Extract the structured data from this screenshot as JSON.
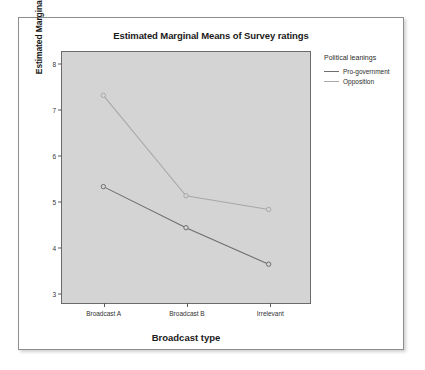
{
  "chart_data": {
    "type": "line",
    "title": "Estimated Marginal Means of Survey ratings",
    "xlabel": "Broadcast type",
    "ylabel": "Estimated Marginal Means",
    "categories": [
      "Broadcast A",
      "Broadcast B",
      "Irrelevant"
    ],
    "yticks": [
      "3",
      "4",
      "5",
      "6",
      "7",
      "8"
    ],
    "ylim": [
      2.75,
      8.25
    ],
    "grid": false,
    "legend_position": "right",
    "legend_title": "Political leanings",
    "series": [
      {
        "name": "Pro-government",
        "values": [
          5.3,
          4.4,
          3.6
        ],
        "color": "#6e6e6e",
        "marker": "circle"
      },
      {
        "name": "Opposition",
        "values": [
          7.3,
          5.1,
          4.8
        ],
        "color": "#a8a8a8",
        "marker": "circle"
      }
    ],
    "plot_background": "#d4d4d4",
    "frame_color": "#6b6b6b"
  }
}
